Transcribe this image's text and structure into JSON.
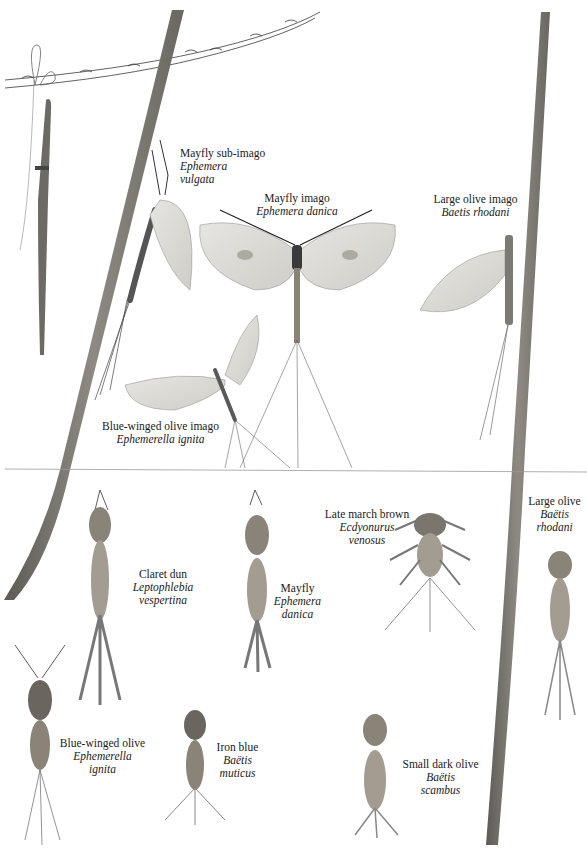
{
  "plate": {
    "description": "Botanical-style illustration plate of mayflies: adult winged forms (imagos / sub-imago) above a water-line, nymphs below",
    "sections": [
      "adults",
      "nymphs"
    ]
  },
  "adults": [
    {
      "id": "mayfly-sub-imago",
      "common": "Mayfly sub-imago",
      "latin_1": "Ephemera",
      "latin_2": "vulgata"
    },
    {
      "id": "mayfly-imago",
      "common": "Mayfly imago",
      "latin_1": "Ephemera danica"
    },
    {
      "id": "large-olive-imago",
      "common": "Large olive imago",
      "latin_1": "Baetis rhodani"
    },
    {
      "id": "blue-winged-olive-imago",
      "common": "Blue-winged olive imago",
      "latin_1": "Ephemerella ignita"
    }
  ],
  "nymphs": [
    {
      "id": "claret-dun",
      "common": "Claret dun",
      "latin_1": "Leptophlebia",
      "latin_2": "vespertina"
    },
    {
      "id": "mayfly-nymph",
      "common": "Mayfly",
      "latin_1": "Ephemera",
      "latin_2": "danica"
    },
    {
      "id": "late-march-brown",
      "common": "Late march brown",
      "latin_1": "Ecdyonurus",
      "latin_2": "venosus"
    },
    {
      "id": "large-olive",
      "common": "Large olive",
      "latin_1": "Baëtis",
      "latin_2": "rhodani"
    },
    {
      "id": "blue-winged-olive",
      "common": "Blue-winged olive",
      "latin_1": "Ephemerella",
      "latin_2": "ignita"
    },
    {
      "id": "iron-blue",
      "common": "Iron blue",
      "latin_1": "Baëtis",
      "latin_2": "muticus"
    },
    {
      "id": "small-dark-olive",
      "common": "Small dark olive",
      "latin_1": "Baëtis",
      "latin_2": "scambus"
    }
  ],
  "colors": {
    "stem": "#7d7a74",
    "stem_dark": "#5e5b56",
    "wing": "#d9d8d3",
    "body": "#8a8478",
    "ink": "#2a2a2a",
    "waterline": "#9a9a9a"
  }
}
